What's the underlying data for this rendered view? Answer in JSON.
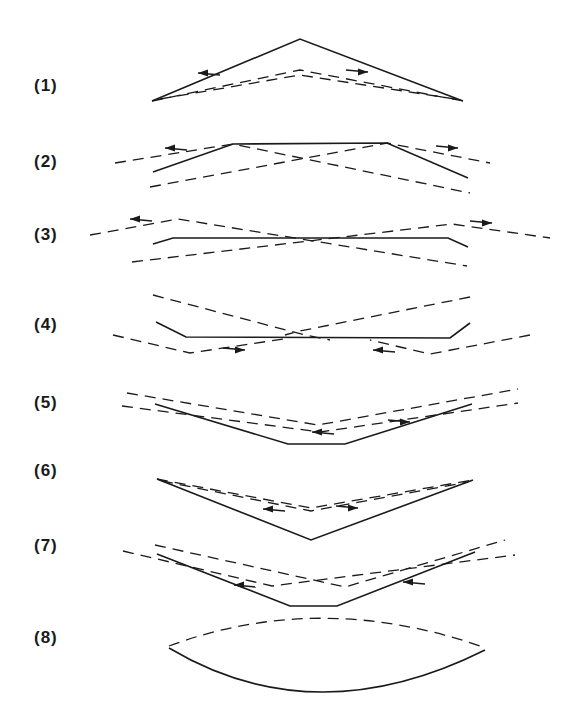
{
  "figure": {
    "panels": [
      {
        "label": "(1)",
        "label_y": 76,
        "solid": "M152,101 L300,39 L463,101",
        "dashed": [
          "M152,101 L300,70 L463,101",
          "M160,99 L300,75 L455,99"
        ],
        "arrows": [
          {
            "x": 198,
            "y": 73,
            "dir": "left"
          },
          {
            "x": 368,
            "y": 72,
            "dir": "right"
          }
        ]
      },
      {
        "label": "(2)",
        "label_y": 152,
        "solid": "M153,172 L233,144 L387,143 L468,178",
        "dashed": [
          "M115,163 L233,144 L470,193",
          "M150,187 L387,143 L490,163"
        ],
        "arrows": [
          {
            "x": 165,
            "y": 148,
            "dir": "left"
          },
          {
            "x": 458,
            "y": 148,
            "dir": "right"
          }
        ]
      },
      {
        "label": "(3)",
        "label_y": 225,
        "solid": "M153,244 L173,238 L448,238 L468,247",
        "dashed": [
          "M90,235 L178,219 L467,266",
          "M132,262 L452,224 L550,238"
        ],
        "arrows": [
          {
            "x": 130,
            "y": 219,
            "dir": "left"
          },
          {
            "x": 492,
            "y": 223,
            "dir": "right"
          }
        ]
      },
      {
        "label": "(4)",
        "label_y": 315,
        "solid": "M156,322 L186,337 L450,338 L470,323",
        "dashed": [
          "M153,295 L305,335 L330,340",
          "M470,297 L300,331 L285,335",
          "M113,335 L190,353 L290,338",
          "M530,335 L430,354 L370,340"
        ],
        "arrows": [
          {
            "x": 245,
            "y": 350,
            "dir": "right"
          },
          {
            "x": 373,
            "y": 350,
            "dir": "left"
          }
        ]
      },
      {
        "label": "(5)",
        "label_y": 393,
        "solid": "M155,404 L288,444 L345,444 L472,404",
        "dashed": [
          "M127,393 L318,425 L518,389",
          "M122,406 L320,432 L518,403"
        ],
        "arrows": [
          {
            "x": 312,
            "y": 432,
            "dir": "left"
          },
          {
            "x": 410,
            "y": 422,
            "dir": "right"
          }
        ]
      },
      {
        "label": "(6)",
        "label_y": 461,
        "solid": "M157,479 L311,540 L473,480",
        "dashed": [
          "M157,479 L311,508 L473,480",
          "M162,481 L311,511 L468,482"
        ],
        "arrows": [
          {
            "x": 263,
            "y": 509,
            "dir": "left"
          },
          {
            "x": 358,
            "y": 508,
            "dir": "right"
          }
        ]
      },
      {
        "label": "(7)",
        "label_y": 536,
        "solid": "M157,554 L290,606 L337,606 L475,552",
        "dashed": [
          "M155,545 L345,587 L505,540",
          "M123,551 L272,586 L515,555"
        ],
        "arrows": [
          {
            "x": 234,
            "y": 585,
            "dir": "left"
          },
          {
            "x": 403,
            "y": 582,
            "dir": "left"
          }
        ]
      },
      {
        "label": "(8)",
        "label_y": 628,
        "solid": "M169,648 Q315,735 485,650",
        "dashed": [
          "M169,646 Q320,590 483,647"
        ],
        "arrows": []
      }
    ]
  }
}
